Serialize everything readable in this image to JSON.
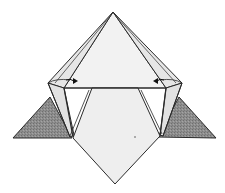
{
  "diagram": {
    "type": "origami-fold-step",
    "colors": {
      "paper": "#eeeeee",
      "paper_light": "#f4f4f4",
      "shaded_flap": "#8a8a8a",
      "line": "#2a2a2a",
      "background": "#ffffff"
    },
    "arrows": [
      {
        "name": "left-fold-arrow",
        "direction": "inward-right"
      },
      {
        "name": "right-fold-arrow",
        "direction": "inward-left"
      }
    ],
    "labels": []
  }
}
